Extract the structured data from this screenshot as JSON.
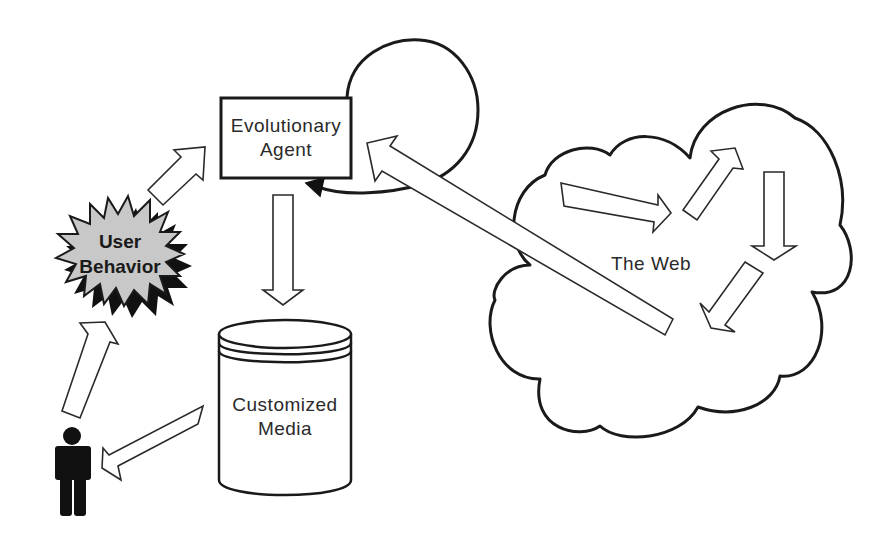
{
  "diagram": {
    "title": "",
    "nodes": {
      "agent": {
        "label_line1": "Evolutionary",
        "label_line2": "Agent",
        "shape": "rectangle"
      },
      "media": {
        "label_line1": "Customized",
        "label_line2": "Media",
        "shape": "cylinder"
      },
      "behavior": {
        "label_line1": "User",
        "label_line2": "Behavior",
        "shape": "starburst",
        "fill": "#c8c8c8"
      },
      "web": {
        "label": "The Web",
        "shape": "cloud"
      },
      "user": {
        "icon": "person-icon",
        "fill": "#111111"
      }
    },
    "edges": [
      {
        "from": "User Behavior",
        "to": "Evolutionary Agent",
        "style": "hollow-arrow"
      },
      {
        "from": "Evolutionary Agent",
        "to": "Customized Media",
        "style": "hollow-arrow"
      },
      {
        "from": "Customized Media",
        "to": "User",
        "style": "hollow-arrow"
      },
      {
        "from": "User",
        "to": "User Behavior",
        "style": "hollow-arrow"
      },
      {
        "from": "The Web",
        "to": "Evolutionary Agent",
        "style": "hollow-arrow"
      },
      {
        "from": "Evolutionary Agent",
        "to": "Evolutionary Agent",
        "style": "self-loop-solid-arrow"
      }
    ],
    "web_internal_arrows": 4,
    "colors": {
      "stroke": "#1a1a1a",
      "background": "#ffffff",
      "starburst_fill": "#c8c8c8",
      "starburst_shadow": "#111111"
    }
  }
}
